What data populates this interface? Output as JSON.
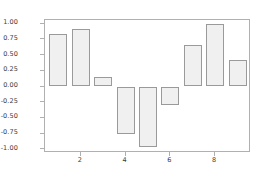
{
  "chart_data": {
    "type": "bar",
    "title": "",
    "xlabel": "",
    "ylabel": "",
    "categories": [
      1,
      2,
      3,
      4,
      5,
      6,
      7,
      8,
      9
    ],
    "values": [
      0.84,
      0.92,
      0.15,
      -0.76,
      -0.96,
      -0.29,
      0.66,
      0.99,
      0.42
    ],
    "series": [
      {
        "name": "",
        "values": [
          0.84,
          0.92,
          0.15,
          -0.76,
          -0.96,
          -0.29,
          0.66,
          0.99,
          0.42
        ]
      }
    ],
    "xlim": [
      0.4,
      9.6
    ],
    "ylim": [
      -1.06,
      1.06
    ],
    "yticks": [
      1.0,
      0.75,
      0.5,
      0.25,
      0.0,
      -0.25,
      -0.5,
      -0.75,
      -1.0
    ],
    "ytick_labels": [
      "1.00",
      "0.75",
      "0.50",
      "0.25",
      "0.00",
      "-0.25",
      "-0.50",
      "-0.75",
      "-1.00"
    ],
    "xticks": [
      2,
      4,
      6,
      8
    ],
    "xtick_labels": [
      "2",
      "4",
      "6",
      "8"
    ],
    "grid": false,
    "legend": null,
    "bar_fill_color": "#f0f0f0",
    "bar_edge_color": "#9a9a9a",
    "axis_color": "#b0b0b0",
    "tick_label_color": "#3a3a3a",
    "background_color": "#ffffff"
  }
}
